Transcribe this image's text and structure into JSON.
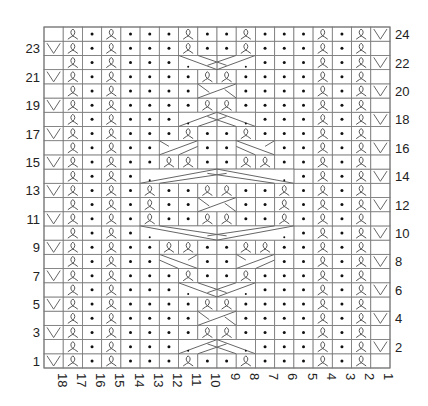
{
  "legend_codes": {
    "k": "twisted-knit-icon",
    "p": "purl-dot-icon",
    "v": "slip-v-icon",
    "e": "empty",
    "x": "cable-cell"
  },
  "grid": {
    "cols": 18,
    "rows": 24,
    "left": 44,
    "top": 27,
    "right": 390,
    "bottom": 368
  },
  "row_labels_left": [
    "1",
    "3",
    "5",
    "7",
    "9",
    "11",
    "13",
    "15",
    "17",
    "19",
    "21",
    "23"
  ],
  "row_labels_right": [
    "2",
    "4",
    "6",
    "8",
    "10",
    "12",
    "14",
    "16",
    "18",
    "20",
    "22",
    "24"
  ],
  "col_labels": [
    "18",
    "17",
    "16",
    "15",
    "14",
    "13",
    "12",
    "11",
    "10",
    "9",
    "8",
    "7",
    "6",
    "5",
    "4",
    "3",
    "2",
    "1"
  ],
  "rows": {
    "24": "ekpkpppkppkpppkpkv",
    "23": "vkpkpppkppkpppkpke",
    "22": "ekpkpppxxxxpppkpkv",
    "21": "vkpkppppkkppppkpke",
    "20": "ekpkppppxxppppkpkv",
    "19": "vkpkppppkkppppkpke",
    "18": "ekpkpppxxxxpppkpkv",
    "17": "vkpkpppkppkpppkpke",
    "16": "ekpkppxxppxxppkpkv",
    "15": "vkpkppkkppkkppkpke",
    "14": "ekpkpxxxxxxxxpkpkv",
    "13": "vkpkpkppkkppkpkpke",
    "12": "ekpkpkppxxppkpkpkv",
    "11": "vkpkpkppkkppkpkpke",
    "10": "ekpkpxxxxxxxxpkpkv",
    "9": "vkpkppkkppkkppkpke",
    "8": "ekpkppxxppxxppkpkv",
    "7": "vkpkpppkppkpppkpke",
    "6": "ekpkpppxxxxpppkpkv",
    "5": "vkpkppppkkppppkpke",
    "4": "ekpkppppxxppppkpkv",
    "3": "vkpkppppkkppppkpke",
    "2": "ekpkpppxxxxpppkpkv",
    "1": "vkpkpppkppkpppkpke"
  },
  "cables": [
    {
      "row": 22,
      "from_col": 11,
      "to_col": 8,
      "type": "v-merge"
    },
    {
      "row": 20,
      "from_col": 10,
      "to_col": 9,
      "type": "cross"
    },
    {
      "row": 18,
      "from_col": 11,
      "to_col": 8,
      "type": "v-split"
    },
    {
      "row": 16,
      "from_col": 12,
      "to_col": 11,
      "type": "left-out"
    },
    {
      "row": 16,
      "from_col": 8,
      "to_col": 7,
      "type": "right-out"
    },
    {
      "row": 14,
      "from_col": 13,
      "to_col": 6,
      "type": "big-split"
    },
    {
      "row": 12,
      "from_col": 10,
      "to_col": 9,
      "type": "cross"
    },
    {
      "row": 10,
      "from_col": 13,
      "to_col": 6,
      "type": "big-merge"
    },
    {
      "row": 8,
      "from_col": 12,
      "to_col": 11,
      "type": "left-in"
    },
    {
      "row": 8,
      "from_col": 8,
      "to_col": 7,
      "type": "right-in"
    },
    {
      "row": 6,
      "from_col": 11,
      "to_col": 8,
      "type": "v-merge"
    },
    {
      "row": 4,
      "from_col": 10,
      "to_col": 9,
      "type": "cross"
    },
    {
      "row": 2,
      "from_col": 11,
      "to_col": 8,
      "type": "v-split"
    }
  ]
}
